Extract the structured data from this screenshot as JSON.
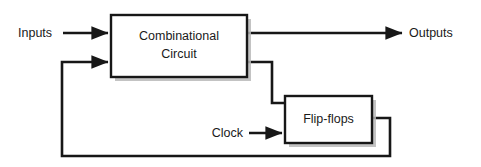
{
  "diagram": {
    "background_color": "#ffffff",
    "line_color": "#171717",
    "box_fill": "#ffffff",
    "shadow_color": "#b9b9b9",
    "blocks": [
      {
        "id": "combinational-circuit",
        "label_line1": "Combinational",
        "label_line2": "Circuit",
        "x": 111,
        "y": 15,
        "width": 136,
        "height": 62
      },
      {
        "id": "flip-flops",
        "label_line1": "Flip-flops",
        "label_line2": "",
        "x": 285,
        "y": 96,
        "width": 87,
        "height": 47
      }
    ],
    "labels": {
      "inputs": "Inputs",
      "outputs": "Outputs",
      "clock": "Clock"
    },
    "signals": [
      {
        "name": "inputs",
        "from": "external",
        "to": "combinational-circuit",
        "arrow": true
      },
      {
        "name": "outputs",
        "from": "combinational-circuit",
        "to": "external",
        "arrow": true
      },
      {
        "name": "next-state",
        "from": "combinational-circuit",
        "to": "flip-flops",
        "arrow": false
      },
      {
        "name": "clock",
        "from": "external",
        "to": "flip-flops",
        "arrow": true
      },
      {
        "name": "present-state-feedback",
        "from": "flip-flops",
        "to": "combinational-circuit",
        "arrow": true
      }
    ]
  }
}
